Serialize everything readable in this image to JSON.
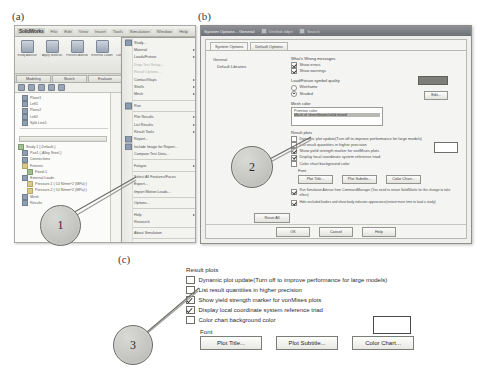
{
  "figure": {
    "panel_labels": {
      "a": "(a)",
      "b": "(b)",
      "c": "(c)"
    },
    "callouts": [
      {
        "id": "1",
        "number": "1"
      },
      {
        "id": "2",
        "number": "2"
      },
      {
        "id": "3",
        "number": "3"
      }
    ],
    "colors": {
      "callout_fill": "#c4c4c0",
      "callout_border": "#6a6a67",
      "dialog_titlebar": "#6d7076",
      "mesh_swatch": "#7d7d79"
    }
  },
  "panel_a": {
    "app_title": "SolidWorks",
    "menubar": [
      "File",
      "Edit",
      "View",
      "Insert",
      "Tools",
      "Simulation",
      "Window",
      "Help"
    ],
    "ribbon_buttons": [
      {
        "label": "Study Advisor"
      },
      {
        "label": "Apply Material"
      },
      {
        "label": "Fixtures Advisor"
      },
      {
        "label": "External Loads"
      },
      {
        "label": "Connections Advisor"
      },
      {
        "label": "Shell Manager"
      },
      {
        "label": "Run"
      }
    ],
    "tabs": [
      "Modeling",
      "Sketch",
      "Evaluate",
      "Simulation",
      "Office Products"
    ],
    "tree_top": [
      "Plane1",
      "Left1",
      "Plane2",
      "Left2",
      "Split Line1"
    ],
    "tree_bottom": [
      "Study 1 (-Default-)",
      "Part1 (-Alloy Steel-)",
      "Connections",
      "Fixtures",
      "Fixed-1",
      "External Loads",
      "Pressure-1 (:10 N/mm^2 (MPa):)",
      "Pressure-2 (:10 N/mm^2 (MPa):)",
      "Mesh",
      "Results"
    ],
    "menu_items": [
      {
        "label": "Study...",
        "type": "item",
        "icon": true
      },
      {
        "label": "Material",
        "type": "submenu"
      },
      {
        "label": "Loads/Fixture",
        "type": "submenu"
      },
      {
        "label": "Drop Test Setup...",
        "type": "disabled"
      },
      {
        "label": "Result Options...",
        "type": "disabled"
      },
      {
        "label": "Contact/Gaps",
        "type": "submenu"
      },
      {
        "label": "Shells",
        "type": "submenu"
      },
      {
        "label": "Mesh",
        "type": "submenu"
      },
      {
        "label": "sep",
        "type": "separator"
      },
      {
        "label": "Run",
        "type": "item",
        "icon": true
      },
      {
        "label": "sep",
        "type": "separator"
      },
      {
        "label": "Plot Results",
        "type": "submenu"
      },
      {
        "label": "List Results",
        "type": "submenu"
      },
      {
        "label": "Result Tools",
        "type": "submenu"
      },
      {
        "label": "Report...",
        "type": "item",
        "icon": true
      },
      {
        "label": "Include Image for Report...",
        "type": "item",
        "icon": true
      },
      {
        "label": "Compare Test Data...",
        "type": "item"
      },
      {
        "label": "sep",
        "type": "separator"
      },
      {
        "label": "Fatigue",
        "type": "submenu"
      },
      {
        "label": "sep",
        "type": "separator"
      },
      {
        "label": "Select All Features/Faces",
        "type": "item"
      },
      {
        "label": "Export...",
        "type": "item"
      },
      {
        "label": "Import Motion Loads...",
        "type": "item"
      },
      {
        "label": "sep",
        "type": "separator"
      },
      {
        "label": "Options...",
        "type": "item"
      },
      {
        "label": "sep",
        "type": "separator"
      },
      {
        "label": "Help",
        "type": "submenu"
      },
      {
        "label": "Research",
        "type": "item"
      },
      {
        "label": "sep",
        "type": "separator"
      },
      {
        "label": "About Simulation",
        "type": "item"
      },
      {
        "label": "sep",
        "type": "separator"
      },
      {
        "label": "Customize Menu",
        "type": "item"
      }
    ]
  },
  "panel_b": {
    "title": "System Options - General",
    "titlebar_extras": [
      "Untitled.sldprt",
      "Search"
    ],
    "tabs": [
      {
        "label": "System Options",
        "active": true
      },
      {
        "label": "Default Options",
        "active": false
      }
    ],
    "tree": [
      "General",
      "Default Libraries"
    ],
    "groups": {
      "whats_wrong": {
        "title": "What's Wrong messages",
        "options": [
          {
            "label": "Show errors",
            "checked": true
          },
          {
            "label": "Show warnings",
            "checked": true
          }
        ]
      },
      "symbol_quality": {
        "title": "Load/Fixture symbol quality",
        "options": [
          {
            "label": "Wireframe",
            "selected": false
          },
          {
            "label": "Shaded",
            "selected": true
          }
        ]
      },
      "mesh_color": {
        "title": "Mesh color",
        "list_items": [
          "Primitive color",
          "Mesh of sheet/beam/solid mixed"
        ],
        "edit_button": "Edit..."
      },
      "result_plots": {
        "title": "Result plots",
        "options": [
          {
            "label": "Dynamic plot update(Turn off to improve performance for large models)",
            "checked": false
          },
          {
            "label": "List result quantities in higher precision",
            "checked": false
          },
          {
            "label": "Show yield strength marker for vonMises plots",
            "checked": true
          },
          {
            "label": "Display local coordinate system reference triad",
            "checked": true
          },
          {
            "label": "Color chart background color",
            "checked": false
          }
        ],
        "font_label": "Font",
        "font_buttons": [
          "Plot Title...",
          "Plot Subtitle...",
          "Color Chart..."
        ]
      },
      "advisor": {
        "options": [
          {
            "label": "Run Simulation Advisor from CommandManager (You need to restart SolidWorks for the change to take effect)",
            "checked": true
          },
          {
            "label": "Hide excluded bodies and show body indicator appearance(instant more time to load a study)",
            "checked": true
          }
        ]
      }
    },
    "reset_button": "Reset All",
    "footer_buttons": [
      "OK",
      "Cancel",
      "Help"
    ]
  },
  "panel_c": {
    "group_title": "Result plots",
    "options": [
      {
        "label": "Dynamic plot update(Turn off to improve performance for large models)",
        "checked": false
      },
      {
        "label": "List result quantities in higher precision",
        "checked": false
      },
      {
        "label": "Show yield strength marker for vonMises plots",
        "checked": true
      },
      {
        "label": "Display local coordinate system reference triad",
        "checked": true
      },
      {
        "label": "Color chart background color",
        "checked": false
      }
    ],
    "font_label": "Font",
    "buttons": [
      "Plot Title...",
      "Plot Subtitle...",
      "Color Chart..."
    ]
  }
}
